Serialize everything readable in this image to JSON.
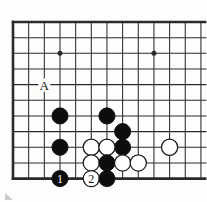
{
  "figure": {
    "kind": "go-board-diagram",
    "background_color": "#fdfdfc",
    "line_color": "#2b2b2b",
    "black_stone_color": "#0d0d0d",
    "white_stone_color": "#ffffff",
    "white_stone_border_color": "#1a1a1a"
  },
  "board": {
    "origin_x": 13.0,
    "origin_y": 22.0,
    "step_x": 15.66,
    "step_y": 15.66,
    "cols": 13,
    "rows": 11,
    "edges": {
      "left": true,
      "top": true,
      "bottom": true,
      "right": false
    },
    "edge_line_width": 2.6,
    "grid_line_width": 1.05,
    "stone_radius": 8.1
  },
  "star_points": [
    {
      "col": 3,
      "row": 2
    },
    {
      "col": 9,
      "row": 2
    }
  ],
  "stones": [
    {
      "color": "black",
      "col": 3,
      "row": 6,
      "label": ""
    },
    {
      "color": "black",
      "col": 6,
      "row": 6,
      "label": ""
    },
    {
      "color": "black",
      "col": 7,
      "row": 7,
      "label": ""
    },
    {
      "color": "black",
      "col": 3,
      "row": 8,
      "label": ""
    },
    {
      "color": "black",
      "col": 7,
      "row": 8,
      "label": ""
    },
    {
      "color": "white",
      "col": 5,
      "row": 8,
      "label": ""
    },
    {
      "color": "white",
      "col": 6,
      "row": 8,
      "label": ""
    },
    {
      "color": "white",
      "col": 10,
      "row": 8,
      "label": ""
    },
    {
      "color": "white",
      "col": 5,
      "row": 9,
      "label": ""
    },
    {
      "color": "black",
      "col": 6,
      "row": 9,
      "label": ""
    },
    {
      "color": "white",
      "col": 7,
      "row": 9,
      "label": ""
    },
    {
      "color": "white",
      "col": 8,
      "row": 9,
      "label": ""
    },
    {
      "color": "black",
      "col": 3,
      "row": 10,
      "label": "1"
    },
    {
      "color": "white",
      "col": 5,
      "row": 10,
      "label": "2"
    },
    {
      "color": "black",
      "col": 6,
      "row": 10,
      "label": ""
    }
  ],
  "markers": [
    {
      "text": "A",
      "col": 2,
      "row": 4
    }
  ],
  "move_numbers": {
    "black_move": "1",
    "white_move": "2",
    "black_label_color": "#ffffff",
    "white_label_color": "#111111"
  }
}
